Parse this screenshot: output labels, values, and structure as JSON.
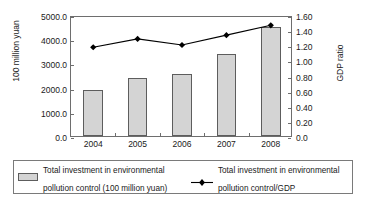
{
  "chart_data": {
    "type": "bar",
    "title": "",
    "subtitle": "",
    "xlabel": "",
    "ylabel": "100 million yuan",
    "y2label": "GDP ratio",
    "categories": [
      "2004",
      "2005",
      "2006",
      "2007",
      "2008"
    ],
    "ylim": [
      0,
      5000
    ],
    "y2lim": [
      0,
      1.6
    ],
    "grid": false,
    "legend_position": "bottom",
    "yticks": [
      "0.0",
      "1000.0",
      "2000.0",
      "3000.0",
      "4000.0",
      "5000.0"
    ],
    "ytick_values": [
      0,
      1000,
      2000,
      3000,
      4000,
      5000
    ],
    "y2ticks": [
      "0.0",
      "0.20",
      "0.40",
      "0.60",
      "0.80",
      "1.00",
      "1.20",
      "1.40",
      "1.60"
    ],
    "y2tick_values": [
      0,
      0.2,
      0.4,
      0.6,
      0.8,
      1.0,
      1.2,
      1.4,
      1.6
    ],
    "series": [
      {
        "name": "Total investment in environmental pollution control (100 million yuan)",
        "type": "bar",
        "axis": "left",
        "color": "#d4d4d4",
        "edge_color": "#5d5d5d",
        "values": [
          1909.8,
          2388.0,
          2566.0,
          3387.6,
          4490.3
        ]
      },
      {
        "name": "Total investment in environmental pollution control/GDP",
        "type": "line",
        "axis": "right",
        "color": "#000000",
        "marker": "diamond",
        "values": [
          1.2,
          1.31,
          1.23,
          1.36,
          1.49
        ]
      }
    ]
  },
  "axes": {
    "left_title": "100 million yuan",
    "right_title": "GDP ratio"
  },
  "legend": {
    "entries": [
      {
        "marker": "bar-swatch",
        "line1": "Total investment in environmental",
        "line2": "pollution control (100 million yuan)"
      },
      {
        "marker": "line-diamond-swatch",
        "line1": "Total investment in environmental",
        "line2": "pollution control/GDP"
      }
    ]
  }
}
